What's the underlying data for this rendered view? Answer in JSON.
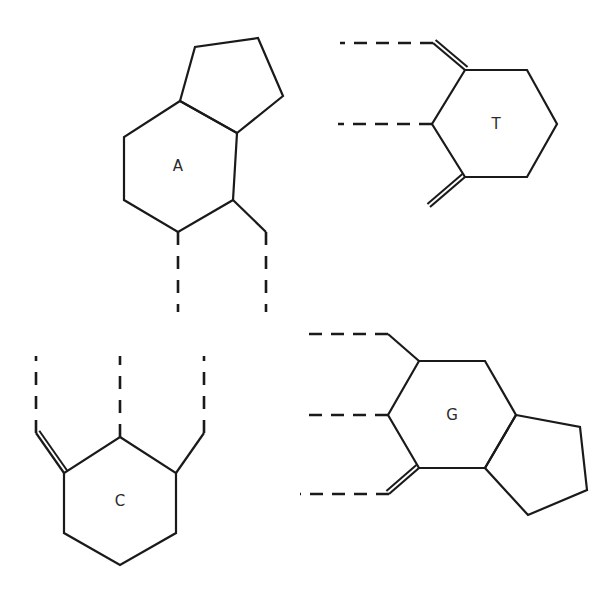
{
  "page": {
    "background_color": "#ffffff",
    "stroke_color": "#1a1a1a",
    "label_color": "#2b2b2b",
    "width": 614,
    "height": 594
  },
  "structures": [
    {
      "id": "adenine",
      "label": "A",
      "label_pos": {
        "x": 178,
        "y": 166
      },
      "description": "fused bicyclic: six-membered ring fused to five-membered ring, two dashed bonds descending from lower vertices",
      "rings": [
        {
          "name": "six-membered-ring",
          "points": "180,101 124,137 124,200 178,232 233,200 237,133"
        },
        {
          "name": "five-membered-ring",
          "points": "180,101 195,47 258,38 283,96 237,133"
        }
      ],
      "bonds": [
        {
          "name": "substituent-bond-right",
          "x1": 233,
          "y1": 200,
          "x2": 266,
          "y2": 232
        }
      ],
      "dashed_bonds": [
        {
          "name": "dashed-bond-left",
          "x1": 178,
          "y1": 232,
          "x2": 178,
          "y2": 312
        },
        {
          "name": "dashed-bond-right",
          "x1": 266,
          "y1": 232,
          "x2": 266,
          "y2": 312
        }
      ]
    },
    {
      "id": "thymine",
      "label": "T",
      "label_pos": {
        "x": 496,
        "y": 124
      },
      "description": "single six-membered ring with two exocyclic double bonds to dashed continuations and one dashed single bond",
      "rings": [
        {
          "name": "six-membered-ring",
          "points": "465,70 527,70 557,124 527,177 465,177 432,124"
        }
      ],
      "bonds": [],
      "double_bonds": [
        {
          "name": "double-bond-upper-left",
          "x1": 465,
          "y1": 70,
          "x2": 433,
          "y2": 43,
          "offset": 4.0
        },
        {
          "name": "double-bond-lower-left",
          "x1": 465,
          "y1": 177,
          "x2": 430,
          "y2": 207,
          "offset": 4.0
        }
      ],
      "dashed_bonds": [
        {
          "name": "dashed-bond-top",
          "x1": 433,
          "y1": 43,
          "x2": 340,
          "y2": 43
        },
        {
          "name": "dashed-bond-middle",
          "x1": 432,
          "y1": 124,
          "x2": 338,
          "y2": 124
        }
      ]
    },
    {
      "id": "cytosine",
      "label": "C",
      "label_pos": {
        "x": 120,
        "y": 501
      },
      "description": "single six-membered ring with three vertical dashed continuations, one via an exocyclic double bond",
      "rings": [
        {
          "name": "six-membered-ring",
          "points": "120,437 176,473 176,533 120,565 64,533 64,473"
        }
      ],
      "bonds": [
        {
          "name": "substituent-bond-right",
          "x1": 176,
          "y1": 473,
          "x2": 204,
          "y2": 433
        }
      ],
      "double_bonds": [
        {
          "name": "double-bond-left",
          "x1": 64,
          "y1": 473,
          "x2": 36,
          "y2": 433,
          "offset": 4.0
        }
      ],
      "dashed_bonds": [
        {
          "name": "dashed-bond-left",
          "x1": 36,
          "y1": 433,
          "x2": 36,
          "y2": 356
        },
        {
          "name": "dashed-bond-middle",
          "x1": 120,
          "y1": 437,
          "x2": 120,
          "y2": 356
        },
        {
          "name": "dashed-bond-right",
          "x1": 204,
          "y1": 433,
          "x2": 204,
          "y2": 356
        }
      ]
    },
    {
      "id": "guanine",
      "label": "G",
      "label_pos": {
        "x": 452,
        "y": 415
      },
      "description": "fused bicyclic: six-membered ring fused to five-membered ring, three dashed bonds to the left, lowest via a double bond",
      "rings": [
        {
          "name": "six-membered-ring",
          "points": "419,361 485,361 516,415 485,468 419,468 388,415"
        },
        {
          "name": "five-membered-ring",
          "points": "516,415 580,427 587,490 528,515 485,468"
        }
      ],
      "bonds": [
        {
          "name": "substituent-bond-upper-left",
          "x1": 419,
          "y1": 361,
          "x2": 388,
          "y2": 334
        }
      ],
      "double_bonds": [
        {
          "name": "double-bond-lower-left",
          "x1": 419,
          "y1": 468,
          "x2": 389,
          "y2": 494,
          "offset": 4.0
        }
      ],
      "dashed_bonds": [
        {
          "name": "dashed-bond-top",
          "x1": 388,
          "y1": 334,
          "x2": 300,
          "y2": 334
        },
        {
          "name": "dashed-bond-middle",
          "x1": 388,
          "y1": 415,
          "x2": 300,
          "y2": 415
        },
        {
          "name": "dashed-bond-bottom",
          "x1": 389,
          "y1": 494,
          "x2": 300,
          "y2": 494
        }
      ]
    }
  ]
}
